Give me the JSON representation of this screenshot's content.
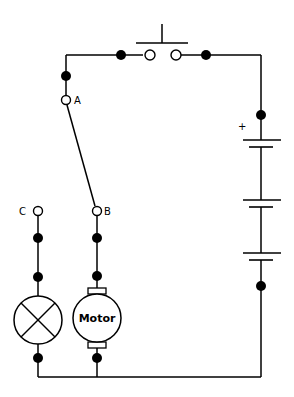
{
  "diagram": {
    "type": "electrical-circuit",
    "labels": {
      "terminal_a": "A",
      "terminal_b": "B",
      "terminal_c": "C",
      "battery_positive": "+",
      "motor": "Motor"
    },
    "components": [
      {
        "id": "push-button-switch",
        "kind": "normally-open push switch"
      },
      {
        "id": "two-way-switch",
        "kind": "changeover switch A to B or C",
        "position": "A-B"
      },
      {
        "id": "battery",
        "kind": "battery of 3 cells",
        "cells": 3
      },
      {
        "id": "lamp",
        "kind": "lamp"
      },
      {
        "id": "motor",
        "kind": "DC motor"
      }
    ]
  }
}
